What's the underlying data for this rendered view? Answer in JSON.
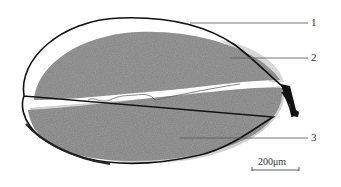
{
  "figure": {
    "type": "micrograph",
    "labels": [
      {
        "id": "1",
        "text": "1",
        "x": 313,
        "y": 24
      },
      {
        "id": "2",
        "text": "2",
        "x": 313,
        "y": 59
      },
      {
        "id": "3",
        "text": "3",
        "x": 313,
        "y": 138
      }
    ],
    "scale_bar": {
      "text": "200μm",
      "x1": 252,
      "x2": 299,
      "y": 170
    }
  },
  "colors": {
    "tissue": "#8c8c8c",
    "tissue_dark": "#6e6e6e",
    "outline": "#111111",
    "leader": "#555555"
  }
}
